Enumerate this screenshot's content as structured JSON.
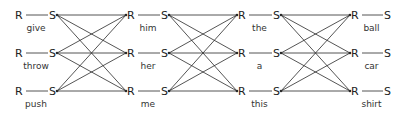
{
  "diagram": {
    "type": "response-stimulus chain network",
    "node_labels": {
      "response": "R",
      "stimulus": "S"
    },
    "rows_y": [
      15,
      53,
      91
    ],
    "columns": [
      {
        "r_x": 15,
        "s_x": 51,
        "words": [
          "give",
          "throw",
          "push"
        ]
      },
      {
        "r_x": 127,
        "s_x": 163,
        "words": [
          "him",
          "her",
          "me"
        ]
      },
      {
        "r_x": 238,
        "s_x": 275,
        "words": [
          "the",
          "a",
          "this"
        ]
      },
      {
        "r_x": 351,
        "s_x": 386,
        "words": [
          "ball",
          "car",
          "shirt"
        ]
      }
    ],
    "connections": "every S in a column connects to every R in the next column (fully connected 3x3 between adjacent columns)",
    "colors": {
      "line": "#2a2a2a",
      "text": "#222222",
      "background": "#ffffff"
    }
  }
}
